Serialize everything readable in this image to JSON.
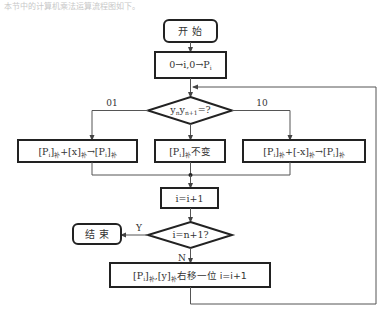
{
  "caption": "本节中的计算机乘法运算流程图如下。",
  "flowchart": {
    "start": {
      "label": "开  始"
    },
    "init": {
      "label_parts": [
        "0→i,0→P",
        "i"
      ]
    },
    "decision1": {
      "label": "y",
      "sub1": "n",
      "mid": "y",
      "sub2": "n+1",
      "tail": "=?"
    },
    "branch_left_label": "01",
    "branch_right_label": "10",
    "box_left": {
      "t1": "[P",
      "s1": "i",
      "t2": "]",
      "s2": "补",
      "t3": "+[x]",
      "s3": "补",
      "t4": "→[P",
      "s4": "i",
      "t5": "]",
      "s5": "补"
    },
    "box_middle": {
      "t1": "[P",
      "s1": "i",
      "t2": "]",
      "s2": "补",
      "t3": "不变"
    },
    "box_right": {
      "t1": "[P",
      "s1": "i",
      "t2": "]",
      "s2": "补",
      "t3": "+[-x]",
      "s3": "补",
      "t4": "→[P",
      "s4": "i",
      "t5": "]",
      "s5": "补"
    },
    "increment": {
      "label": "i=i+1"
    },
    "decision2": {
      "label": "i=n+1?"
    },
    "yes_label": "Y",
    "no_label": "N",
    "end": {
      "label": "结  束"
    },
    "shift_box": {
      "t1": "[P",
      "s1": "i",
      "t2": "]",
      "s2": "补",
      "t3": ",[y]",
      "s3": "补",
      "t4": "右移一位 i=i+1"
    }
  },
  "colors": {
    "stroke": "#222222",
    "line": "#555555",
    "text": "#333333",
    "background": "#ffffff"
  }
}
